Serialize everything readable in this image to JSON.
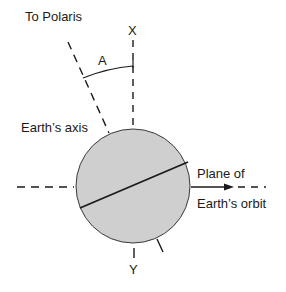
{
  "labels": {
    "polaris": "To Polaris",
    "x": "X",
    "angle": "A",
    "axis": "Earth’s axis",
    "orbit_line1": "Plane of",
    "orbit_line2": "Earth’s orbit",
    "y": "Y"
  },
  "colors": {
    "earth_fill": "#cfcfcf",
    "stroke": "#1a1a1a"
  }
}
